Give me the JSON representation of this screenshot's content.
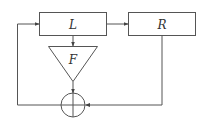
{
  "diagram": {
    "nodes": {
      "L": {
        "label": "L",
        "shape": "rectangle"
      },
      "R": {
        "label": "R",
        "shape": "rectangle"
      },
      "F": {
        "label": "F",
        "shape": "triangle"
      },
      "sum": {
        "label": "",
        "shape": "circle-plus"
      }
    },
    "edges": [
      {
        "from": "L",
        "to": "R"
      },
      {
        "from": "L",
        "to": "F"
      },
      {
        "from": "F",
        "to": "sum"
      },
      {
        "from": "R",
        "to": "sum"
      },
      {
        "from": "sum",
        "to": "L"
      }
    ],
    "colors": {
      "stroke": "#555555",
      "background": "#ffffff"
    }
  }
}
